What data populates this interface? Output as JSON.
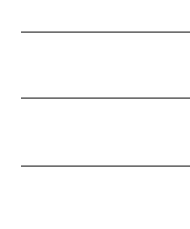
{
  "lines": [
    {
      "y": 32,
      "color": "#6e6e6e"
    },
    {
      "y": 98,
      "color": "#6e6e6e"
    },
    {
      "y": 166,
      "color": "#6e6e6e"
    }
  ]
}
